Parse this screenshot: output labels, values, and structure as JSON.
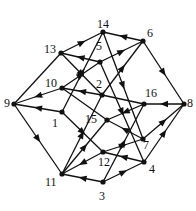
{
  "diagram": {
    "title": "",
    "type": "directed-graph",
    "colors": {
      "edge": "#111111",
      "node": "#111111",
      "label": "#111111",
      "background": "#ffffff"
    },
    "nodes": [
      {
        "id": "1",
        "label": "1",
        "x": 62,
        "y": 112,
        "lx": 52,
        "ly": 117
      },
      {
        "id": "2",
        "label": "2",
        "x": 102,
        "y": 95,
        "lx": 96,
        "ly": 78
      },
      {
        "id": "3",
        "label": "3",
        "x": 103,
        "y": 182,
        "lx": 99,
        "ly": 190
      },
      {
        "id": "4",
        "label": "4",
        "x": 144,
        "y": 162,
        "lx": 149,
        "ly": 163
      },
      {
        "id": "5",
        "label": "5",
        "x": 100,
        "y": 62,
        "lx": 96,
        "ly": 40
      },
      {
        "id": "6",
        "label": "6",
        "x": 143,
        "y": 41,
        "lx": 147,
        "ly": 27
      },
      {
        "id": "7",
        "label": "7",
        "x": 143,
        "y": 139,
        "lx": 143,
        "ly": 139
      },
      {
        "id": "8",
        "label": "8",
        "x": 184,
        "y": 104,
        "lx": 187,
        "ly": 97
      },
      {
        "id": "9",
        "label": "9",
        "x": 14,
        "y": 104,
        "lx": 4,
        "ly": 97
      },
      {
        "id": "10",
        "label": "10",
        "x": 62,
        "y": 88,
        "lx": 45,
        "ly": 77
      },
      {
        "id": "11",
        "label": "11",
        "x": 62,
        "y": 174,
        "lx": 45,
        "ly": 176
      },
      {
        "id": "12",
        "label": "12",
        "x": 103,
        "y": 152,
        "lx": 98,
        "ly": 156
      },
      {
        "id": "13",
        "label": "13",
        "x": 61,
        "y": 53,
        "lx": 44,
        "ly": 43
      },
      {
        "id": "14",
        "label": "14",
        "x": 103,
        "y": 32,
        "lx": 97,
        "ly": 18
      },
      {
        "id": "15",
        "label": "15",
        "x": 107,
        "y": 120,
        "lx": 85,
        "ly": 113
      },
      {
        "id": "16",
        "label": "16",
        "x": 144,
        "y": 104,
        "lx": 145,
        "ly": 87
      }
    ],
    "edges": [
      {
        "from": "9",
        "to": "13",
        "arrow": false
      },
      {
        "from": "10",
        "to": "9",
        "arrow": true
      },
      {
        "from": "1",
        "to": "9",
        "arrow": true
      },
      {
        "from": "9",
        "to": "11",
        "arrow": true
      },
      {
        "from": "13",
        "to": "14",
        "arrow": true
      },
      {
        "from": "6",
        "to": "14",
        "arrow": true
      },
      {
        "from": "13",
        "to": "2",
        "arrow": true
      },
      {
        "from": "5",
        "to": "13",
        "arrow": true
      },
      {
        "from": "10",
        "to": "5",
        "arrow": true
      },
      {
        "from": "2",
        "to": "10",
        "arrow": true
      },
      {
        "from": "10",
        "to": "15",
        "arrow": false
      },
      {
        "from": "1",
        "to": "14",
        "arrow": true
      },
      {
        "from": "1",
        "to": "12",
        "arrow": true
      },
      {
        "from": "11",
        "to": "2",
        "arrow": true
      },
      {
        "from": "11",
        "to": "15",
        "arrow": true
      },
      {
        "from": "12",
        "to": "11",
        "arrow": true
      },
      {
        "from": "3",
        "to": "11",
        "arrow": true
      },
      {
        "from": "3",
        "to": "4",
        "arrow": true
      },
      {
        "from": "3",
        "to": "16",
        "arrow": true
      },
      {
        "from": "4",
        "to": "12",
        "arrow": true
      },
      {
        "from": "4",
        "to": "8",
        "arrow": true
      },
      {
        "from": "12",
        "to": "7",
        "arrow": true
      },
      {
        "from": "7",
        "to": "8",
        "arrow": true
      },
      {
        "from": "8",
        "to": "16",
        "arrow": true
      },
      {
        "from": "6",
        "to": "8",
        "arrow": true
      },
      {
        "from": "5",
        "to": "6",
        "arrow": true
      },
      {
        "from": "2",
        "to": "6",
        "arrow": true
      },
      {
        "from": "14",
        "to": "7",
        "arrow": true
      },
      {
        "from": "5",
        "to": "4",
        "arrow": true
      },
      {
        "from": "16",
        "to": "15",
        "arrow": true
      },
      {
        "from": "7",
        "to": "15",
        "arrow": true
      },
      {
        "from": "16",
        "to": "2",
        "arrow": false
      }
    ]
  }
}
